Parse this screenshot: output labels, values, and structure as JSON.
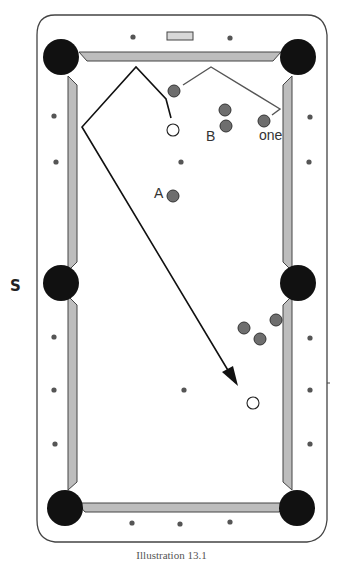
{
  "diagram": {
    "colors": {
      "frame": "#444444",
      "cushion": "#bdbdbd",
      "pocket": "#111111",
      "ball": "#6e6e6e",
      "cue_ball": "#ffffff",
      "diamond": "#555555",
      "path_black": "#111111",
      "path_gray": "#555555"
    },
    "labels": {
      "ball_a": "A",
      "ball_b": "B",
      "ball_one": "one",
      "side_marker": "S"
    },
    "caption": "Illustration 13.1",
    "pockets": [
      {
        "name": "top-left",
        "x": 61,
        "y": 57
      },
      {
        "name": "top-right",
        "x": 298,
        "y": 57
      },
      {
        "name": "middle-left",
        "x": 61,
        "y": 283
      },
      {
        "name": "middle-right",
        "x": 298,
        "y": 283
      },
      {
        "name": "bottom-left",
        "x": 65,
        "y": 508
      },
      {
        "name": "bottom-right",
        "x": 297,
        "y": 508
      }
    ],
    "object_balls": [
      {
        "id": "upper-shot-ball",
        "x": 174,
        "y": 91
      },
      {
        "id": "b-top",
        "x": 225,
        "y": 110
      },
      {
        "id": "b",
        "x": 226,
        "y": 126
      },
      {
        "id": "one",
        "x": 264,
        "y": 121
      },
      {
        "id": "a",
        "x": 173,
        "y": 196
      },
      {
        "id": "cluster-1",
        "x": 244,
        "y": 328
      },
      {
        "id": "cluster-2",
        "x": 260,
        "y": 339
      },
      {
        "id": "cluster-3",
        "x": 276,
        "y": 320
      }
    ],
    "cue_balls": [
      {
        "id": "cue-upper",
        "x": 173,
        "y": 130
      },
      {
        "id": "cue-lower",
        "x": 253,
        "y": 403
      }
    ],
    "diamonds": [
      {
        "x": 133,
        "y": 37
      },
      {
        "x": 230,
        "y": 38
      },
      {
        "x": 54,
        "y": 116
      },
      {
        "x": 310,
        "y": 117
      },
      {
        "x": 56,
        "y": 162
      },
      {
        "x": 309,
        "y": 162
      },
      {
        "x": 54,
        "y": 337
      },
      {
        "x": 310,
        "y": 338
      },
      {
        "x": 54,
        "y": 390
      },
      {
        "x": 310,
        "y": 390
      },
      {
        "x": 55,
        "y": 444
      },
      {
        "x": 310,
        "y": 444
      },
      {
        "x": 132,
        "y": 523
      },
      {
        "x": 180,
        "y": 524
      },
      {
        "x": 230,
        "y": 522
      },
      {
        "x": 181,
        "y": 162
      },
      {
        "x": 184,
        "y": 390
      }
    ],
    "black_path": [
      [
        171,
        118
      ],
      [
        166,
        99
      ],
      [
        136,
        67
      ],
      [
        82,
        127
      ],
      [
        235,
        382
      ]
    ],
    "gray_path": [
      [
        183,
        85
      ],
      [
        211,
        67
      ],
      [
        280,
        109
      ],
      [
        272,
        115
      ]
    ]
  }
}
